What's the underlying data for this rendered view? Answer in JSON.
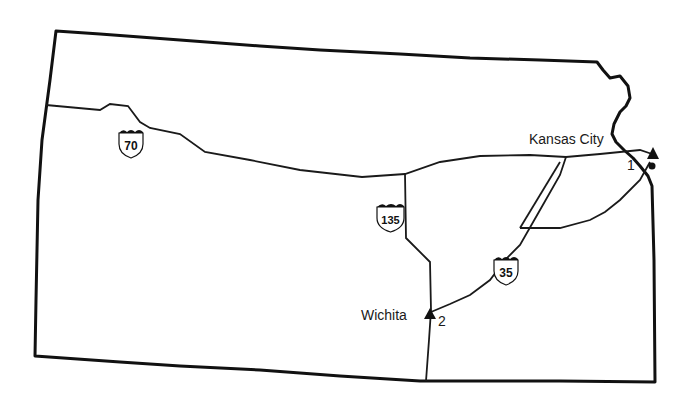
{
  "map": {
    "region": "Kansas",
    "colors": {
      "border": "#111111",
      "road": "#1a1a1a",
      "background": "#ffffff"
    },
    "cities": [
      {
        "name": "Kansas City",
        "marker_label": "1"
      },
      {
        "name": "Wichita",
        "marker_label": "2"
      }
    ],
    "highways": [
      {
        "route": "70"
      },
      {
        "route": "135"
      },
      {
        "route": "35"
      }
    ]
  }
}
